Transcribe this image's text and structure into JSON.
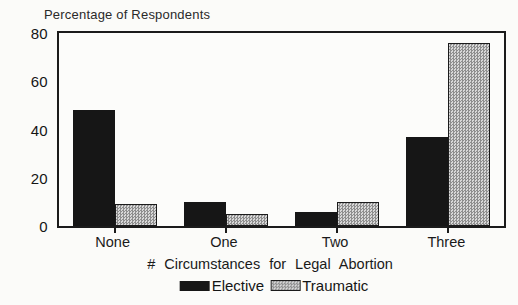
{
  "chart_data": {
    "type": "bar",
    "title": "Percentage of Respondents",
    "xlabel": "# Circumstances for Legal Abortion",
    "ylabel": "",
    "categories": [
      "None",
      "One",
      "Two",
      "Three"
    ],
    "series": [
      {
        "name": "Elective",
        "style": "solid",
        "color": "#161616",
        "values": [
          48,
          10,
          6,
          37
        ]
      },
      {
        "name": "Traumatic",
        "style": "checker",
        "color": "#c9c9c9",
        "values": [
          9,
          5,
          10,
          76
        ]
      }
    ],
    "ylim": [
      0,
      80
    ],
    "yticks": [
      0,
      20,
      40,
      60,
      80
    ],
    "grid": false,
    "legend_position": "bottom-center"
  },
  "colors": {
    "bar_elective": "#161616",
    "bar_traumatic_light": "#d8d8d8",
    "bar_traumatic_dark": "#8e8e8e",
    "frame": "#1b1b1b",
    "background": "#fbfbf9"
  }
}
